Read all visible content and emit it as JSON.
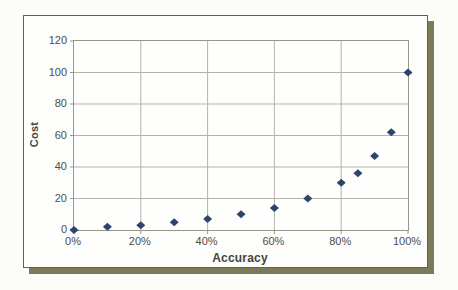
{
  "figure": {
    "page_bg": "#fcfcf9",
    "card_bg": "#fdfdfb",
    "plot_bg": "#fefefc",
    "card_border": "#63625a",
    "shadow_color": "#7c7a58",
    "text_color": "#45443e",
    "tick_text_color": "#4f4e48"
  },
  "chart_data": {
    "type": "scatter",
    "title": "",
    "xlabel": "Accuracy",
    "ylabel": "Cost",
    "x": [
      0,
      10,
      20,
      30,
      40,
      50,
      60,
      70,
      80,
      85,
      90,
      95,
      100
    ],
    "y": [
      0,
      2,
      3,
      5,
      7,
      10,
      14,
      20,
      30,
      36,
      47,
      62,
      100
    ],
    "xlim": [
      0,
      100
    ],
    "ylim": [
      0,
      120
    ],
    "x_tick_values": [
      0,
      20,
      40,
      60,
      80,
      100
    ],
    "x_tick_labels": [
      "0%",
      "20%",
      "40%",
      "60%",
      "80%",
      "100%"
    ],
    "y_tick_values": [
      0,
      20,
      40,
      60,
      80,
      100,
      120
    ],
    "y_tick_labels": [
      "0",
      "20",
      "40",
      "60",
      "80",
      "100",
      "120"
    ],
    "grid": true,
    "legend": "none",
    "marker": {
      "shape": "diamond",
      "color": "#2e4470",
      "width": 9,
      "height": 8
    },
    "grid_color": "#b3b2ab",
    "axis_color": "#97958c"
  }
}
